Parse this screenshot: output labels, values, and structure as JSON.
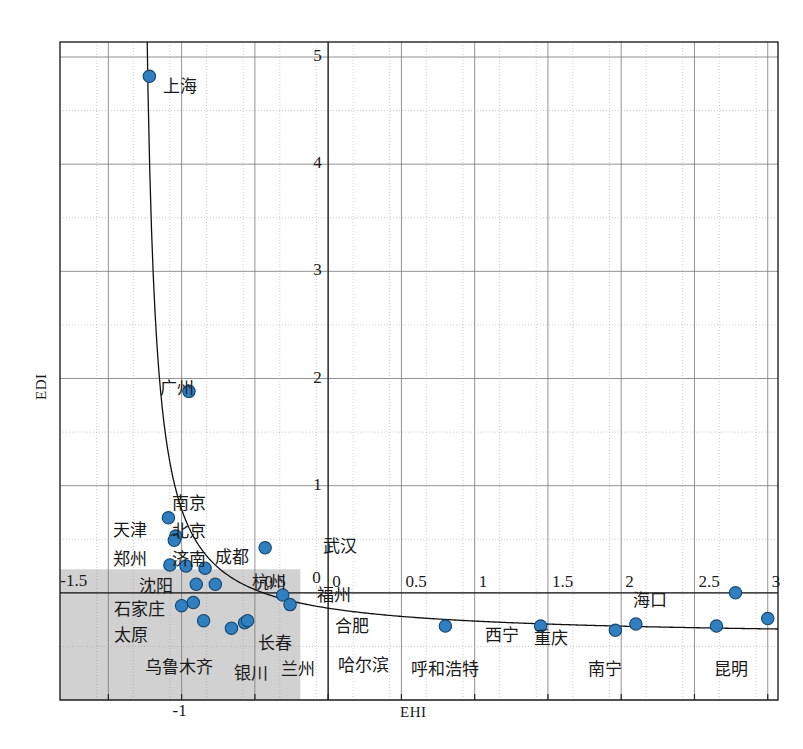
{
  "chart_data": {
    "type": "scatter",
    "title": "",
    "xlabel": "EHI",
    "ylabel": "EDI",
    "xlim": [
      -1.83,
      3.07
    ],
    "ylim": [
      -1.0,
      5.14
    ],
    "xticks": [
      -1.5,
      -1,
      -0.5,
      0,
      0.5,
      1,
      1.5,
      2,
      2.5,
      3
    ],
    "yticks": [
      -1,
      0,
      1,
      2,
      3,
      4,
      5
    ],
    "xtick_labels": [
      "-1.5",
      "-1",
      "-0.5",
      "0",
      "0.5",
      "1",
      "1.5",
      "2",
      "2.5",
      "3"
    ],
    "ytick_labels": [
      "-1",
      "0",
      "1",
      "2",
      "3",
      "4",
      "5"
    ],
    "grid": true,
    "legend": "none",
    "marker_color": "#2f7fc1",
    "marker_edge_color": "#16456b",
    "shaded_region": {
      "x0": -1.83,
      "x1": -0.19,
      "y0": -1.0,
      "y1": 0.22
    },
    "fit_curve": "hyperbolic decay",
    "points": [
      {
        "label": "上海",
        "x": -1.22,
        "y": 4.82
      },
      {
        "label": "广州",
        "x": -0.95,
        "y": 1.88
      },
      {
        "label": "南京",
        "x": -1.09,
        "y": 0.7
      },
      {
        "label": "北京",
        "x": -1.04,
        "y": 0.53
      },
      {
        "label": "天津",
        "x": -1.05,
        "y": 0.49
      },
      {
        "label": "济南",
        "x": -1.08,
        "y": 0.26
      },
      {
        "label": "郑州",
        "x": -0.97,
        "y": 0.25
      },
      {
        "label": "成都",
        "x": -0.84,
        "y": 0.23
      },
      {
        "label": "沈阳",
        "x": -0.9,
        "y": 0.08
      },
      {
        "label": "杭州",
        "x": -0.77,
        "y": 0.08
      },
      {
        "label": "石家庄",
        "x": -0.92,
        "y": -0.09
      },
      {
        "label": "武汉",
        "x": -0.43,
        "y": 0.42
      },
      {
        "label": "福州",
        "x": -0.31,
        "y": -0.02
      },
      {
        "label": "合肥",
        "x": -0.26,
        "y": -0.11
      },
      {
        "label": "太原",
        "x": -1.0,
        "y": -0.12
      },
      {
        "label": "乌鲁木齐",
        "x": -0.85,
        "y": -0.26
      },
      {
        "label": "银川",
        "x": -0.66,
        "y": -0.33
      },
      {
        "label": "兰州",
        "x": -0.57,
        "y": -0.28
      },
      {
        "label": "长春",
        "x": -0.55,
        "y": -0.26
      },
      {
        "label": "哈尔滨",
        "x": 0.8,
        "y": -0.31
      },
      {
        "label": "呼和浩特",
        "x": 1.45,
        "y": -0.31
      },
      {
        "label": "西宁",
        "x": 1.96,
        "y": -0.35
      },
      {
        "label": "重庆",
        "x": 2.1,
        "y": -0.29
      },
      {
        "label": "南宁",
        "x": 2.65,
        "y": -0.31
      },
      {
        "label": "海口",
        "x": 2.78,
        "y": -0.0
      },
      {
        "label": "昆明",
        "x": 3.0,
        "y": -0.24
      }
    ],
    "labels_layout": [
      {
        "text": "上海",
        "x": 163,
        "y": 78
      },
      {
        "text": "广州",
        "x": 160,
        "y": 380
      },
      {
        "text": "南京",
        "x": 172,
        "y": 495
      },
      {
        "text": "天津",
        "x": 113,
        "y": 522
      },
      {
        "text": "北京",
        "x": 172,
        "y": 523
      },
      {
        "text": "郑州",
        "x": 113,
        "y": 551
      },
      {
        "text": "济南",
        "x": 172,
        "y": 551
      },
      {
        "text": "成都",
        "x": 215,
        "y": 549
      },
      {
        "text": "杭州",
        "x": 252,
        "y": 574
      },
      {
        "text": "武汉",
        "x": 323,
        "y": 538
      },
      {
        "text": "福州",
        "x": 317,
        "y": 587
      },
      {
        "text": "沈阳",
        "x": 139,
        "y": 578
      },
      {
        "text": "石家庄",
        "x": 114,
        "y": 601
      },
      {
        "text": "太原",
        "x": 114,
        "y": 627
      },
      {
        "text": "合肥",
        "x": 335,
        "y": 618
      },
      {
        "text": "长春",
        "x": 258,
        "y": 635
      },
      {
        "text": "乌鲁木齐",
        "x": 145,
        "y": 659
      },
      {
        "text": "银川",
        "x": 234,
        "y": 665
      },
      {
        "text": "兰州",
        "x": 281,
        "y": 661
      },
      {
        "text": "哈尔滨",
        "x": 338,
        "y": 657
      },
      {
        "text": "呼和浩特",
        "x": 411,
        "y": 661
      },
      {
        "text": "西宁",
        "x": 485,
        "y": 627
      },
      {
        "text": "重庆",
        "x": 534,
        "y": 630
      },
      {
        "text": "南宁",
        "x": 588,
        "y": 661
      },
      {
        "text": "海口",
        "x": 633,
        "y": 592
      },
      {
        "text": "昆明",
        "x": 714,
        "y": 661
      }
    ]
  },
  "axis": {
    "x_title": "EHI",
    "y_title": "EDI"
  }
}
